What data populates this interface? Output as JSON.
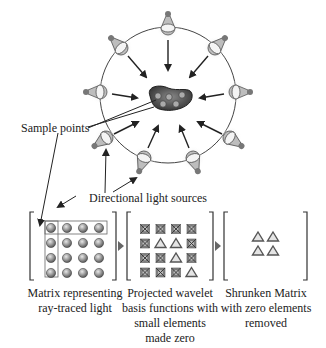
{
  "labels": {
    "sample_points": "Sample points",
    "directional_light_sources": "Directional light sources"
  },
  "matrices": [
    {
      "caption_line1": "Matrix representing",
      "caption_line2": "ray-traced light",
      "rows": 4,
      "cols": 4,
      "cells": [
        [
          "sphere",
          "sphere",
          "sphere",
          "sphere"
        ],
        [
          "sphere",
          "sphere",
          "sphere",
          "sphere"
        ],
        [
          "sphere",
          "sphere",
          "sphere",
          "sphere"
        ],
        [
          "sphere",
          "sphere",
          "sphere",
          "sphere"
        ]
      ]
    },
    {
      "caption_line1": "Projected wavelet",
      "caption_line2": "basis functions with",
      "caption_line3": "small elements",
      "caption_line4": "made zero",
      "rows": 4,
      "cols": 4,
      "cells": [
        [
          "zero",
          "zero",
          "zero",
          "zero"
        ],
        [
          "zero",
          "triangle",
          "triangle",
          "zero"
        ],
        [
          "zero",
          "zero",
          "triangle",
          "zero"
        ],
        [
          "zero",
          "zero",
          "zero",
          "triangle"
        ]
      ]
    },
    {
      "caption_line1": "Shrunken Matrix",
      "caption_line2": "with zero elements",
      "caption_line3": "removed",
      "rows": 2,
      "cols": 2,
      "cells": [
        [
          "triangle",
          "triangle"
        ],
        [
          "triangle",
          "triangle"
        ]
      ]
    }
  ],
  "scene": {
    "light_count": 10,
    "sample_point_count": 6
  },
  "colors": {
    "line": "#333333",
    "sphere": "#9a9a9a",
    "object": "#555555",
    "bulb": "#bbbbbb"
  }
}
